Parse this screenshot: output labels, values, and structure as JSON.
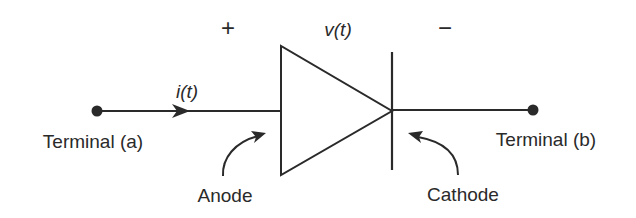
{
  "diagram": {
    "colors": {
      "stroke": "#2a2a2a",
      "background": "#ffffff"
    },
    "labels": {
      "plus": "+",
      "minus": "−",
      "voltage": "v(t)",
      "current": "i(t)",
      "terminal_a": "Terminal (a)",
      "terminal_b": "Terminal (b)",
      "anode": "Anode",
      "cathode": "Cathode"
    },
    "components": [
      {
        "id": "terminal-a-node",
        "type": "node"
      },
      {
        "id": "diode",
        "type": "diode-symbol"
      },
      {
        "id": "terminal-b-node",
        "type": "node"
      }
    ],
    "connections": [
      {
        "from": "terminal-a-node",
        "to": "diode-anode",
        "annotation": "current i(t) flows left to right"
      },
      {
        "from": "diode-cathode",
        "to": "terminal-b-node"
      }
    ]
  }
}
